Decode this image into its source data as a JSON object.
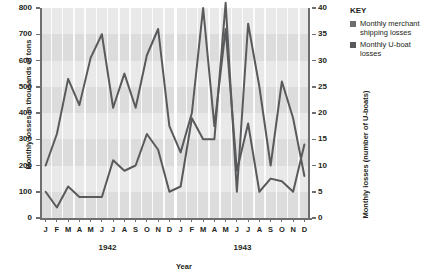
{
  "chart_data": {
    "type": "line",
    "title": "",
    "xlabel": "Year",
    "ylabel": "Monthly losses in thousands of tons",
    "ylabel_right": "Monthly losses (number of U-boats)",
    "ylim": [
      0,
      800
    ],
    "ylim_right": [
      0,
      40
    ],
    "yticks": [
      "0",
      "100",
      "200",
      "300",
      "400",
      "500",
      "600",
      "700",
      "800"
    ],
    "yticks_right": [
      "0",
      "5",
      "10",
      "15",
      "20",
      "25",
      "30",
      "35",
      "40"
    ],
    "grid": "horizontal-bands",
    "legend_position": "right",
    "x": [
      "J",
      "F",
      "M",
      "A",
      "M",
      "J",
      "J",
      "A",
      "S",
      "O",
      "N",
      "D",
      "J",
      "F",
      "M",
      "A",
      "M",
      "J",
      "J",
      "A",
      "S",
      "O",
      "N",
      "D"
    ],
    "x_groups": [
      {
        "label": "1942",
        "months": [
          "J",
          "F",
          "M",
          "A",
          "M",
          "J",
          "J",
          "A",
          "S",
          "O",
          "N",
          "D"
        ]
      },
      {
        "label": "1943",
        "months": [
          "J",
          "F",
          "M",
          "A",
          "M",
          "J",
          "J",
          "A",
          "S",
          "O",
          "N",
          "D"
        ]
      }
    ],
    "series": [
      {
        "name": "Monthly merchant shipping losses",
        "axis": "left",
        "units": "thousands of tons",
        "color": "#595a5c",
        "values": [
          200,
          320,
          530,
          430,
          610,
          700,
          420,
          550,
          420,
          620,
          720,
          350,
          250,
          400,
          800,
          350,
          720,
          180,
          360,
          100,
          150,
          140,
          100,
          280
        ]
      },
      {
        "name": "Monthly U-boat losses",
        "axis": "right",
        "units": "number of U-boats",
        "color": "#595a5c",
        "values": [
          5,
          2,
          6,
          4,
          4,
          4,
          11,
          9,
          10,
          16,
          13,
          5,
          6,
          19,
          15,
          15,
          41,
          5,
          37,
          25,
          10,
          26,
          19,
          8
        ]
      }
    ]
  },
  "legend": {
    "title": "KEY",
    "entries": [
      {
        "label": "Monthly merchant shipping losses",
        "color": "#6d6e70"
      },
      {
        "label": "Monthly U-boat losses",
        "color": "#58595b"
      }
    ]
  }
}
